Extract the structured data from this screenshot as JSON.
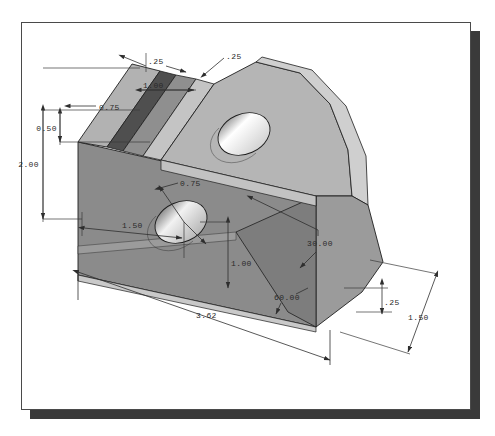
{
  "document": {
    "type": "engineering-drawing",
    "view": "isometric-pictorial",
    "units_note": "",
    "sheet_background": "#ffffff",
    "sheet_border_color": "#4a4a4a",
    "shadow_color": "#3a3a3a"
  },
  "model": {
    "name": "angle-bracket-block",
    "shading": {
      "top_face": "#b4b4b4",
      "front_face": "#8a8a8a",
      "right_face": "#a0a0a0",
      "slot_inner_dark": "#5a5a5a",
      "chamfer_light": "#c8c8c8",
      "hole_bore_light": "#efefef",
      "hole_bore_mid": "#c0c0c0",
      "outline": "#1e1e1e"
    }
  },
  "dimensions": [
    {
      "id": "d-top-left-025",
      "label": ".25",
      "kind": "linear",
      "x": 148,
      "y": 62
    },
    {
      "id": "d-top-right-025",
      "label": ".25",
      "kind": "leader",
      "x": 228,
      "y": 57
    },
    {
      "id": "d-depth-100",
      "label": "1.00",
      "kind": "linear",
      "x": 141,
      "y": 93
    },
    {
      "id": "d-height-075",
      "label": "0.75",
      "kind": "linear",
      "x": 98,
      "y": 110
    },
    {
      "id": "d-height-050",
      "label": "0.50",
      "kind": "linear",
      "x": 62,
      "y": 128
    },
    {
      "id": "d-height-200",
      "label": "2.00",
      "kind": "linear",
      "x": 46,
      "y": 164
    },
    {
      "id": "d-hole-dia-075",
      "label": "0.75",
      "kind": "diameter",
      "x": 181,
      "y": 184
    },
    {
      "id": "d-hole-x-150",
      "label": "1.50",
      "kind": "linear",
      "x": 125,
      "y": 231
    },
    {
      "id": "d-hole-y-100",
      "label": "1.00",
      "kind": "linear",
      "x": 228,
      "y": 264
    },
    {
      "id": "d-angle-3000",
      "label": "30.00",
      "kind": "angular",
      "x": 321,
      "y": 242
    },
    {
      "id": "d-angle-6000",
      "label": "60.00",
      "kind": "angular",
      "x": 287,
      "y": 298
    },
    {
      "id": "d-length-362",
      "label": "3.62",
      "kind": "linear",
      "x": 201,
      "y": 316
    },
    {
      "id": "d-right-025",
      "label": ".25",
      "kind": "linear",
      "x": 386,
      "y": 302
    },
    {
      "id": "d-width-150",
      "label": "1.50",
      "kind": "linear",
      "x": 413,
      "y": 318
    }
  ]
}
